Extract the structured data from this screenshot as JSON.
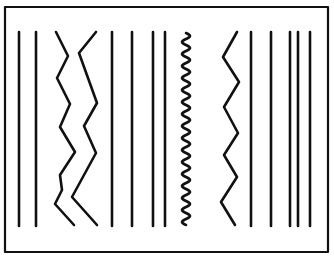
{
  "diagram": {
    "colors": {
      "background": "#ffffff",
      "stroke": "#111111"
    },
    "frame": {
      "x": 5,
      "y": 7,
      "width": 323,
      "height": 245,
      "stroke_width": 2.2
    },
    "line_top": 32,
    "line_bottom": 226,
    "stroke_width": 2.6,
    "elements": [
      {
        "kind": "straight",
        "x": 19
      },
      {
        "kind": "straight",
        "x": 36
      },
      {
        "kind": "zigzag",
        "name": "zigzag-left-1",
        "points": [
          [
            56,
            32
          ],
          [
            68,
            56
          ],
          [
            57,
            78
          ],
          [
            70,
            104
          ],
          [
            60,
            127
          ],
          [
            75,
            152
          ],
          [
            60,
            175
          ],
          [
            62,
            190
          ],
          [
            55,
            204
          ],
          [
            74,
            225
          ]
        ]
      },
      {
        "kind": "zigzag",
        "name": "zigzag-left-2",
        "points": [
          [
            96,
            32
          ],
          [
            79,
            53
          ],
          [
            97,
            103
          ],
          [
            84,
            126
          ],
          [
            96,
            153
          ],
          [
            72,
            197
          ],
          [
            97,
            225
          ]
        ]
      },
      {
        "kind": "straight",
        "x": 112
      },
      {
        "kind": "straight",
        "x": 132
      },
      {
        "kind": "straight",
        "x": 153
      },
      {
        "kind": "straight",
        "x": 165
      },
      {
        "kind": "wavy",
        "name": "wavy-center",
        "x_center": 186,
        "amplitude": 4,
        "y_start": 33,
        "y_end": 225,
        "cycles": 16
      },
      {
        "kind": "zigzag",
        "name": "zigzag-right",
        "points": [
          [
            237,
            32
          ],
          [
            223,
            57
          ],
          [
            239,
            82
          ],
          [
            224,
            107
          ],
          [
            238,
            133
          ],
          [
            224,
            155
          ],
          [
            237,
            177
          ],
          [
            221,
            202
          ],
          [
            235,
            225
          ]
        ]
      },
      {
        "kind": "straight",
        "x": 251
      },
      {
        "kind": "straight",
        "x": 271
      },
      {
        "kind": "straight",
        "x": 290
      },
      {
        "kind": "straight",
        "x": 298
      },
      {
        "kind": "straight",
        "x": 310
      }
    ]
  }
}
